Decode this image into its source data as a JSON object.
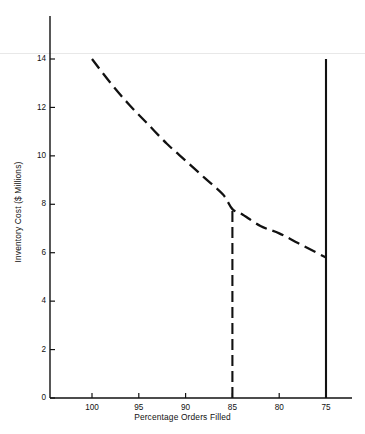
{
  "figure": {
    "clipped_header": "",
    "background": "#ffffff",
    "ink": "#111111",
    "rule_color": "#e8e8e8"
  },
  "chart_data": {
    "type": "line",
    "title": "",
    "xlabel": "Percentage Orders Filled",
    "ylabel": "Inventory Cost ($ Millions)",
    "x_ticks": [
      100,
      95,
      90,
      85,
      80,
      75
    ],
    "x_tick_labels": [
      "100",
      "95",
      "90",
      "85",
      "80",
      "75"
    ],
    "y_ticks": [
      0,
      2,
      4,
      6,
      8,
      10,
      12,
      14
    ],
    "y_tick_labels": [
      "0",
      "2",
      "4",
      "6",
      "8",
      "10",
      "12",
      "14"
    ],
    "xlim": [
      102.5,
      73.0
    ],
    "ylim": [
      0,
      14.6
    ],
    "x_axis_reversed": true,
    "grid": false,
    "legend": null,
    "series": [
      {
        "name": "Inventory Cost",
        "style": "dashed",
        "color": "#111111",
        "x": [
          100,
          98,
          96,
          94,
          92,
          90,
          88,
          86,
          85,
          84,
          82,
          80,
          78,
          76,
          75
        ],
        "values": [
          14.0,
          13.0,
          12.1,
          11.3,
          10.5,
          9.8,
          9.1,
          8.4,
          7.8,
          7.6,
          7.1,
          6.8,
          6.4,
          6.0,
          5.8
        ]
      }
    ],
    "annotations": [
      {
        "name": "service-level-dropline",
        "type": "vertical-line",
        "style": "dashed",
        "x": 85,
        "y_from": 0,
        "y_to": 7.8,
        "color": "#111111"
      },
      {
        "name": "cutoff-line",
        "type": "vertical-line",
        "style": "solid",
        "x": 75,
        "y_from": 0,
        "y_to": 14.0,
        "color": "#111111"
      }
    ]
  }
}
